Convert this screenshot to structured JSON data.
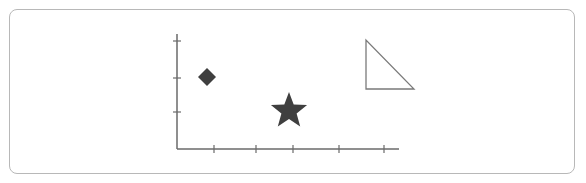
{
  "figure": {
    "colors": {
      "axis": "#6a6a6a",
      "shape_fill": "#3f3f3f",
      "outline": "#7a7a7a",
      "frame": "#b8b8b8"
    },
    "axes": {
      "origin": [
        177,
        149
      ],
      "x_end": 399,
      "y_end": 34,
      "x_ticks": [
        214,
        256,
        293,
        339,
        384
      ],
      "y_ticks": [
        41,
        78,
        112
      ],
      "tick_labels": []
    },
    "shapes": [
      {
        "type": "diamond",
        "filled": true,
        "center": [
          207,
          77
        ],
        "half_size": 9
      },
      {
        "type": "star",
        "filled": true,
        "center": [
          289,
          111
        ],
        "outer_radius": 19,
        "inner_radius": 8
      },
      {
        "type": "right-triangle",
        "filled": false,
        "points": [
          [
            366,
            40
          ],
          [
            366,
            89
          ],
          [
            414,
            89
          ]
        ]
      }
    ]
  }
}
